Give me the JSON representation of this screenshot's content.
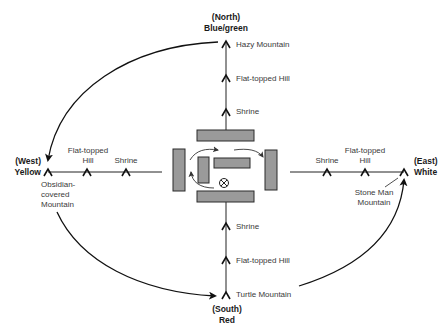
{
  "directions": {
    "north": {
      "paren": "(North)",
      "color": "Blue/green"
    },
    "west": {
      "paren": "(West)",
      "color": "Yellow"
    },
    "east": {
      "paren": "(East)",
      "color": "White"
    },
    "south": {
      "paren": "(South)",
      "color": "Red"
    }
  },
  "north_axis": {
    "sites": [
      "Hazy Mountain",
      "Flat-topped Hill",
      "Shrine"
    ]
  },
  "south_axis": {
    "sites": [
      "Shrine",
      "Flat-topped Hill",
      "Turtle Mountain"
    ]
  },
  "west_axis": {
    "endpoint": [
      "Obsidian-",
      "covered",
      "Mountain"
    ],
    "hill": [
      "Flat-topped",
      "Hill"
    ],
    "shrine": "Shrine"
  },
  "east_axis": {
    "endpoint": [
      "Stone Man",
      "Mountain"
    ],
    "hill": [
      "Flat-topped",
      "Hill"
    ],
    "shrine": "Shrine"
  },
  "center": {
    "marker_symbol": "⊗",
    "block_fill": "#9a9a9a"
  },
  "circuit": {
    "order": [
      "North",
      "West",
      "South",
      "East"
    ]
  }
}
